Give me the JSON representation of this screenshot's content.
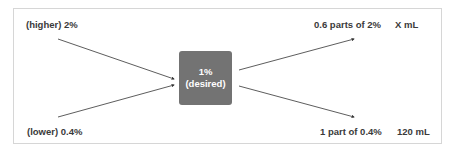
{
  "diagram": {
    "type": "mixing-alligation",
    "left": {
      "higher": "(higher) 2%",
      "lower": "(lower) 0.4%"
    },
    "center": {
      "line1": "1%",
      "line2": "(desired)",
      "fill_color": "#737373"
    },
    "right": {
      "top_parts": "0.6 parts of 2%",
      "top_volume": "X mL",
      "bottom_parts": "1 part of 0.4%",
      "bottom_volume": "120 mL"
    },
    "arrows": [
      {
        "from": "(higher) 2%",
        "to": "1% (desired)"
      },
      {
        "from": "(lower) 0.4%",
        "to": "1% (desired)"
      },
      {
        "from": "1% (desired)",
        "to": "0.6 parts of 2%"
      },
      {
        "from": "1% (desired)",
        "to": "1 part of 0.4%"
      }
    ]
  }
}
